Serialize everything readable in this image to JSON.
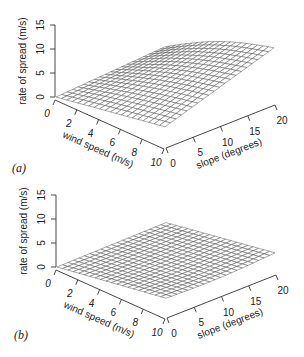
{
  "chart_data": [
    {
      "type": "surface",
      "panel_label": "(a)",
      "zlabel": "rate of spread (m/s)",
      "xlabel": "wind speed (m/s)",
      "ylabel": "slope (degrees)",
      "x_ticks": [
        "0",
        "2",
        "4",
        "6",
        "8",
        "10"
      ],
      "y_ticks": [
        "0",
        "5",
        "10",
        "15",
        "20"
      ],
      "z_ticks": [
        "0",
        "5",
        "10",
        "15"
      ],
      "xlim": [
        0,
        10
      ],
      "ylim": [
        0,
        20
      ],
      "zlim": [
        0,
        15
      ],
      "grid": {
        "wind_steps": 20,
        "slope_steps": 20
      },
      "corner_values": {
        "w0_s0": 0.0,
        "w10_s0": 4.0,
        "w0_s20": 1.5,
        "w10_s20": 11.5
      },
      "description": "Rate of spread rises with both wind speed and slope, steepest at high wind and high slope"
    },
    {
      "type": "surface",
      "panel_label": "(b)",
      "zlabel": "rate of spread (m/s)",
      "xlabel": "wind speed (m/s)",
      "ylabel": "slope (degrees)",
      "x_ticks": [
        "0",
        "2",
        "4",
        "6",
        "8",
        "10"
      ],
      "y_ticks": [
        "0",
        "5",
        "10",
        "15",
        "20"
      ],
      "z_ticks": [
        "0",
        "5",
        "10",
        "15"
      ],
      "xlim": [
        0,
        10
      ],
      "ylim": [
        0,
        20
      ],
      "zlim": [
        0,
        15
      ],
      "grid": {
        "wind_steps": 20,
        "slope_steps": 20
      },
      "corner_values": {
        "w0_s0": 0.0,
        "w10_s0": 3.7,
        "w0_s20": 0.3,
        "w10_s20": 4.2
      },
      "description": "Rate of spread increases mainly with wind speed; slope has a small effect"
    }
  ],
  "panels": {
    "a": {
      "label": "(a)"
    },
    "b": {
      "label": "(b)"
    }
  }
}
